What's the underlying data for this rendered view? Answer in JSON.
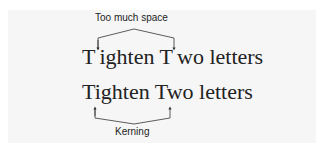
{
  "annotations": {
    "top_label": "Too much space",
    "bottom_label": "Kerning"
  },
  "lines": {
    "unkerned": {
      "first_letter": "T",
      "rest_word1": "ighten",
      "space": " ",
      "second_letter": "T",
      "rest_word2": "wo letters"
    },
    "kerned": {
      "text": "Tighten Two letters"
    }
  },
  "colors": {
    "panel": "#f6f6f6",
    "text": "#222222",
    "arrow": "#333333"
  }
}
